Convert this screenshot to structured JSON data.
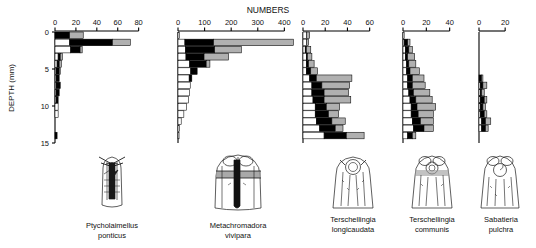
{
  "figure": {
    "title": "NUMBERS",
    "y_axis_label": "DEPTH (mm)",
    "depth_ticks": [
      "0",
      "5",
      "10",
      "15"
    ],
    "depth_range": [
      0,
      15.5
    ],
    "orientation": "horizontal-stacked-bars",
    "note": "Five nematode species depth profiles with head anatomy drawings"
  },
  "chart_data": [
    {
      "type": "bar",
      "orientation": "horizontal",
      "stacked": true,
      "title": "Ptycholaimellus ponticus",
      "xlabel": "NUMBERS",
      "ylabel": "DEPTH (mm)",
      "xlim": [
        0,
        88
      ],
      "ylim": [
        0,
        15.5
      ],
      "xticks": [
        0,
        20,
        40,
        60,
        80
      ],
      "xtick_labels": [
        "0",
        "20",
        "40",
        "60",
        "80"
      ],
      "grid": false,
      "legend": [
        "white",
        "black",
        "grey"
      ],
      "categories": [
        "0-1",
        "1-2",
        "2-3",
        "3-4",
        "4-5",
        "5-6",
        "6-7",
        "7-8",
        "8-9",
        "9-10",
        "10-11",
        "11-12",
        "12-13",
        "13-14",
        "14-15"
      ],
      "series": [
        {
          "name": "white",
          "values": [
            0,
            14,
            15,
            3,
            2,
            1,
            1,
            1,
            1,
            1,
            3,
            3,
            0,
            0,
            0
          ]
        },
        {
          "name": "black",
          "values": [
            14,
            41,
            9,
            2,
            2,
            3,
            3,
            4,
            3,
            2,
            0,
            0,
            0,
            0,
            2
          ]
        },
        {
          "name": "grey",
          "values": [
            13,
            17,
            2,
            2,
            2,
            1,
            0,
            0,
            0,
            0,
            0,
            0,
            0,
            0,
            0
          ]
        }
      ]
    },
    {
      "type": "bar",
      "orientation": "horizontal",
      "stacked": true,
      "title": "Metachromadora vivipara",
      "xlabel": "NUMBERS",
      "ylabel": "",
      "xlim": [
        0,
        440
      ],
      "ylim": [
        0,
        15.5
      ],
      "xticks": [
        0,
        100,
        200,
        300,
        400
      ],
      "xtick_labels": [
        "0",
        "100",
        "200",
        "300",
        "400"
      ],
      "grid": false,
      "legend": [
        "white",
        "black",
        "grey"
      ],
      "categories": [
        "0-1",
        "1-2",
        "2-3",
        "3-4",
        "4-5",
        "5-6",
        "6-7",
        "7-8",
        "8-9",
        "9-10",
        "10-11",
        "11-12",
        "12-13",
        "13-14",
        "14-15"
      ],
      "series": [
        {
          "name": "white",
          "values": [
            6,
            26,
            28,
            30,
            44,
            48,
            42,
            46,
            44,
            40,
            32,
            22,
            12,
            6,
            4
          ]
        },
        {
          "name": "black",
          "values": [
            0,
            108,
            110,
            68,
            62,
            24,
            10,
            0,
            0,
            0,
            0,
            0,
            0,
            0,
            0
          ]
        },
        {
          "name": "grey",
          "values": [
            0,
            300,
            100,
            92,
            14,
            0,
            0,
            0,
            0,
            0,
            0,
            0,
            0,
            0,
            0
          ]
        }
      ]
    },
    {
      "type": "bar",
      "orientation": "horizontal",
      "stacked": true,
      "title": "Terschellingia longicaudata",
      "xlabel": "NUMBERS",
      "ylabel": "",
      "xlim": [
        0,
        72
      ],
      "ylim": [
        0,
        15.5
      ],
      "xticks": [
        0,
        20,
        40,
        60
      ],
      "xtick_labels": [
        "0",
        "20",
        "40",
        "60"
      ],
      "grid": false,
      "legend": [
        "white",
        "black",
        "grey"
      ],
      "categories": [
        "0-1",
        "1-2",
        "2-3",
        "3-4",
        "4-5",
        "5-6",
        "6-7",
        "7-8",
        "8-9",
        "9-10",
        "10-11",
        "11-12",
        "12-13",
        "13-14",
        "14-15"
      ],
      "series": [
        {
          "name": "white",
          "values": [
            3,
            3,
            2,
            3,
            3,
            3,
            6,
            8,
            8,
            9,
            11,
            11,
            12,
            15,
            19
          ]
        },
        {
          "name": "black",
          "values": [
            0,
            0,
            1,
            1,
            2,
            4,
            6,
            9,
            11,
            10,
            10,
            12,
            14,
            14,
            20
          ]
        },
        {
          "name": "grey",
          "values": [
            3,
            2,
            4,
            4,
            5,
            6,
            32,
            25,
            22,
            24,
            12,
            9,
            12,
            7,
            16
          ]
        }
      ]
    },
    {
      "type": "bar",
      "orientation": "horizontal",
      "stacked": true,
      "title": "Terschellingia communis",
      "xlabel": "NUMBERS",
      "ylabel": "",
      "xlim": [
        0,
        48
      ],
      "ylim": [
        0,
        15.5
      ],
      "xticks": [
        0,
        20,
        40
      ],
      "xtick_labels": [
        "0",
        "20",
        "40"
      ],
      "grid": false,
      "legend": [
        "white",
        "black",
        "grey"
      ],
      "categories": [
        "0-1",
        "1-2",
        "2-3",
        "3-4",
        "4-5",
        "5-6",
        "6-7",
        "7-8",
        "8-9",
        "9-10",
        "10-11",
        "11-12",
        "12-13",
        "13-14",
        "14-15"
      ],
      "series": [
        {
          "name": "white",
          "values": [
            1,
            1,
            2,
            2,
            3,
            3,
            4,
            4,
            5,
            6,
            7,
            7,
            8,
            9,
            4
          ]
        },
        {
          "name": "black",
          "values": [
            0,
            3,
            3,
            2,
            2,
            3,
            4,
            4,
            4,
            5,
            5,
            6,
            7,
            9,
            4
          ]
        },
        {
          "name": "grey",
          "values": [
            0,
            2,
            3,
            6,
            6,
            8,
            10,
            11,
            14,
            14,
            16,
            13,
            11,
            8,
            3
          ]
        }
      ]
    },
    {
      "type": "bar",
      "orientation": "horizontal",
      "stacked": true,
      "title": "Sabatieria pulchra",
      "xlabel": "NUMBERS",
      "ylabel": "",
      "xlim": [
        0,
        26
      ],
      "ylim": [
        0,
        15.5
      ],
      "xticks": [
        0,
        20
      ],
      "xtick_labels": [
        "0",
        "20"
      ],
      "grid": false,
      "legend": [
        "white",
        "black",
        "grey"
      ],
      "categories": [
        "0-1",
        "1-2",
        "2-3",
        "3-4",
        "4-5",
        "5-6",
        "6-7",
        "7-8",
        "8-9",
        "9-10",
        "10-11",
        "11-12",
        "12-13",
        "13-14",
        "14-15"
      ],
      "series": [
        {
          "name": "white",
          "values": [
            0,
            0,
            0,
            0,
            0,
            0,
            0,
            1,
            1,
            1,
            1,
            1,
            2,
            2,
            0
          ]
        },
        {
          "name": "black",
          "values": [
            0,
            0,
            0,
            0,
            0,
            0,
            2,
            2,
            1,
            3,
            2,
            3,
            3,
            3,
            0
          ]
        },
        {
          "name": "grey",
          "values": [
            0,
            0,
            0,
            0,
            0,
            0,
            1,
            3,
            2,
            2,
            2,
            2,
            4,
            2,
            0
          ]
        }
      ]
    }
  ],
  "species_labels": [
    {
      "genus": "Ptycholaimellus",
      "species": "ponticus"
    },
    {
      "genus": "Metachromadora",
      "species": "vivipara"
    },
    {
      "genus": "Terschellingia",
      "species": "longicaudata"
    },
    {
      "genus": "Terschellingia",
      "species": "communis"
    },
    {
      "genus": "Sabatieria",
      "species": "pulchra"
    }
  ],
  "drawings": [
    {
      "name": "head-drawing-ptycholaimellus"
    },
    {
      "name": "head-drawing-metachromadora"
    },
    {
      "name": "head-drawing-terschellingia-longicaudata"
    },
    {
      "name": "head-drawing-terschellingia-communis"
    },
    {
      "name": "head-drawing-sabatieria"
    }
  ],
  "colors": {
    "fill_white": "#ffffff",
    "fill_black": "#000000",
    "fill_grey": "#b0b0b0",
    "stroke": "#000000",
    "background": "#ffffff",
    "text": "#111111"
  }
}
